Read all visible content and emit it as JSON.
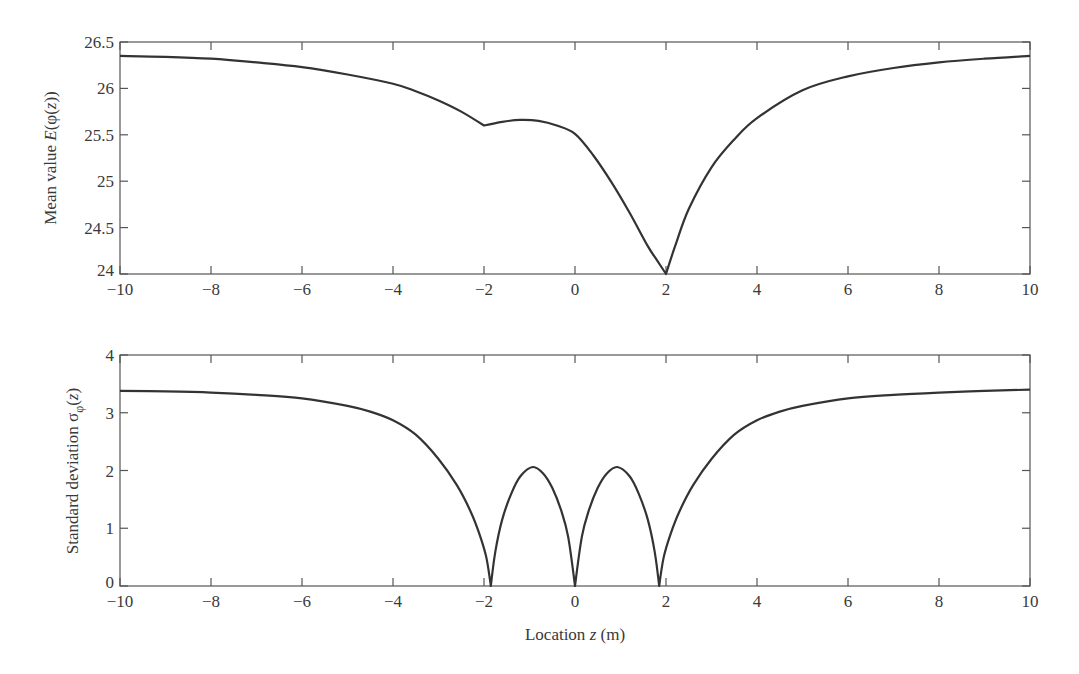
{
  "figure": {
    "xlabel_prefix": "Location ",
    "xlabel_var": "z",
    "xlabel_suffix": " (m)"
  },
  "chart_data": [
    {
      "type": "line",
      "title": "",
      "xlabel": "Location z (m)",
      "ylabel": "Mean value E(φ(z))",
      "ylabel_parts": {
        "prefix": "Mean value ",
        "func": "E",
        "open": "(φ(",
        "var": "z",
        "close": "))"
      },
      "xlim": [
        -10,
        10
      ],
      "ylim": [
        24,
        26.5
      ],
      "xticks": [
        -10,
        -8,
        -6,
        -4,
        -2,
        0,
        2,
        4,
        6,
        8,
        10
      ],
      "yticks": [
        24,
        24.5,
        25,
        25.5,
        26,
        26.5
      ],
      "ytick_labels": [
        "24",
        "24.5",
        "25",
        "25.5",
        "26",
        "26.5"
      ],
      "grid": false,
      "legend": null,
      "series": [
        {
          "name": "E(φ(z))",
          "x": [
            -10,
            -9,
            -8,
            -7,
            -6,
            -5,
            -4,
            -3.5,
            -3,
            -2.5,
            -2,
            -1.6,
            -1.2,
            -0.8,
            -0.4,
            0,
            0.4,
            0.8,
            1.2,
            1.6,
            1.8,
            2,
            2.2,
            2.5,
            3,
            3.5,
            4,
            5,
            6,
            7,
            8,
            9,
            10
          ],
          "y": [
            26.35,
            26.34,
            26.32,
            26.28,
            26.23,
            26.15,
            26.05,
            25.97,
            25.87,
            25.75,
            25.6,
            25.64,
            25.66,
            25.65,
            25.6,
            25.51,
            25.28,
            24.99,
            24.66,
            24.3,
            24.15,
            24.0,
            24.3,
            24.7,
            25.15,
            25.45,
            25.68,
            25.98,
            26.13,
            26.22,
            26.28,
            26.32,
            26.35
          ]
        }
      ]
    },
    {
      "type": "line",
      "title": "",
      "xlabel": "Location z (m)",
      "ylabel": "Standard deviation σφ(z)",
      "ylabel_parts": {
        "prefix": "Standard deviation ",
        "sigma": "σ",
        "sub": "φ",
        "open": "(",
        "var": "z",
        "close": ")"
      },
      "xlim": [
        -10,
        10
      ],
      "ylim": [
        0,
        4
      ],
      "xticks": [
        -10,
        -8,
        -6,
        -4,
        -2,
        0,
        2,
        4,
        6,
        8,
        10
      ],
      "yticks": [
        0,
        1,
        2,
        3,
        4
      ],
      "ytick_labels": [
        "0",
        "1",
        "2",
        "3",
        "4"
      ],
      "grid": false,
      "legend": null,
      "series": [
        {
          "name": "σφ(z)",
          "x": [
            -10,
            -9,
            -8,
            -7,
            -6,
            -5,
            -4.5,
            -4,
            -3.5,
            -3,
            -2.6,
            -2.3,
            -2.1,
            -1.95,
            -1.85,
            -1.75,
            -1.6,
            -1.4,
            -1.2,
            -0.93,
            -0.7,
            -0.5,
            -0.3,
            -0.15,
            0,
            0.15,
            0.3,
            0.5,
            0.7,
            0.93,
            1.2,
            1.4,
            1.6,
            1.75,
            1.85,
            1.95,
            2.1,
            2.3,
            2.6,
            3,
            3.5,
            4,
            4.5,
            5,
            6,
            7,
            8,
            9,
            10
          ],
          "y": [
            3.38,
            3.37,
            3.35,
            3.31,
            3.25,
            3.12,
            3.02,
            2.87,
            2.62,
            2.2,
            1.75,
            1.3,
            0.9,
            0.5,
            0.0,
            0.6,
            1.15,
            1.6,
            1.9,
            2.06,
            1.95,
            1.7,
            1.3,
            0.85,
            0.0,
            0.85,
            1.3,
            1.7,
            1.95,
            2.06,
            1.9,
            1.6,
            1.15,
            0.6,
            0.0,
            0.5,
            0.9,
            1.3,
            1.75,
            2.2,
            2.62,
            2.87,
            3.02,
            3.12,
            3.25,
            3.31,
            3.35,
            3.38,
            3.4
          ]
        }
      ]
    }
  ]
}
